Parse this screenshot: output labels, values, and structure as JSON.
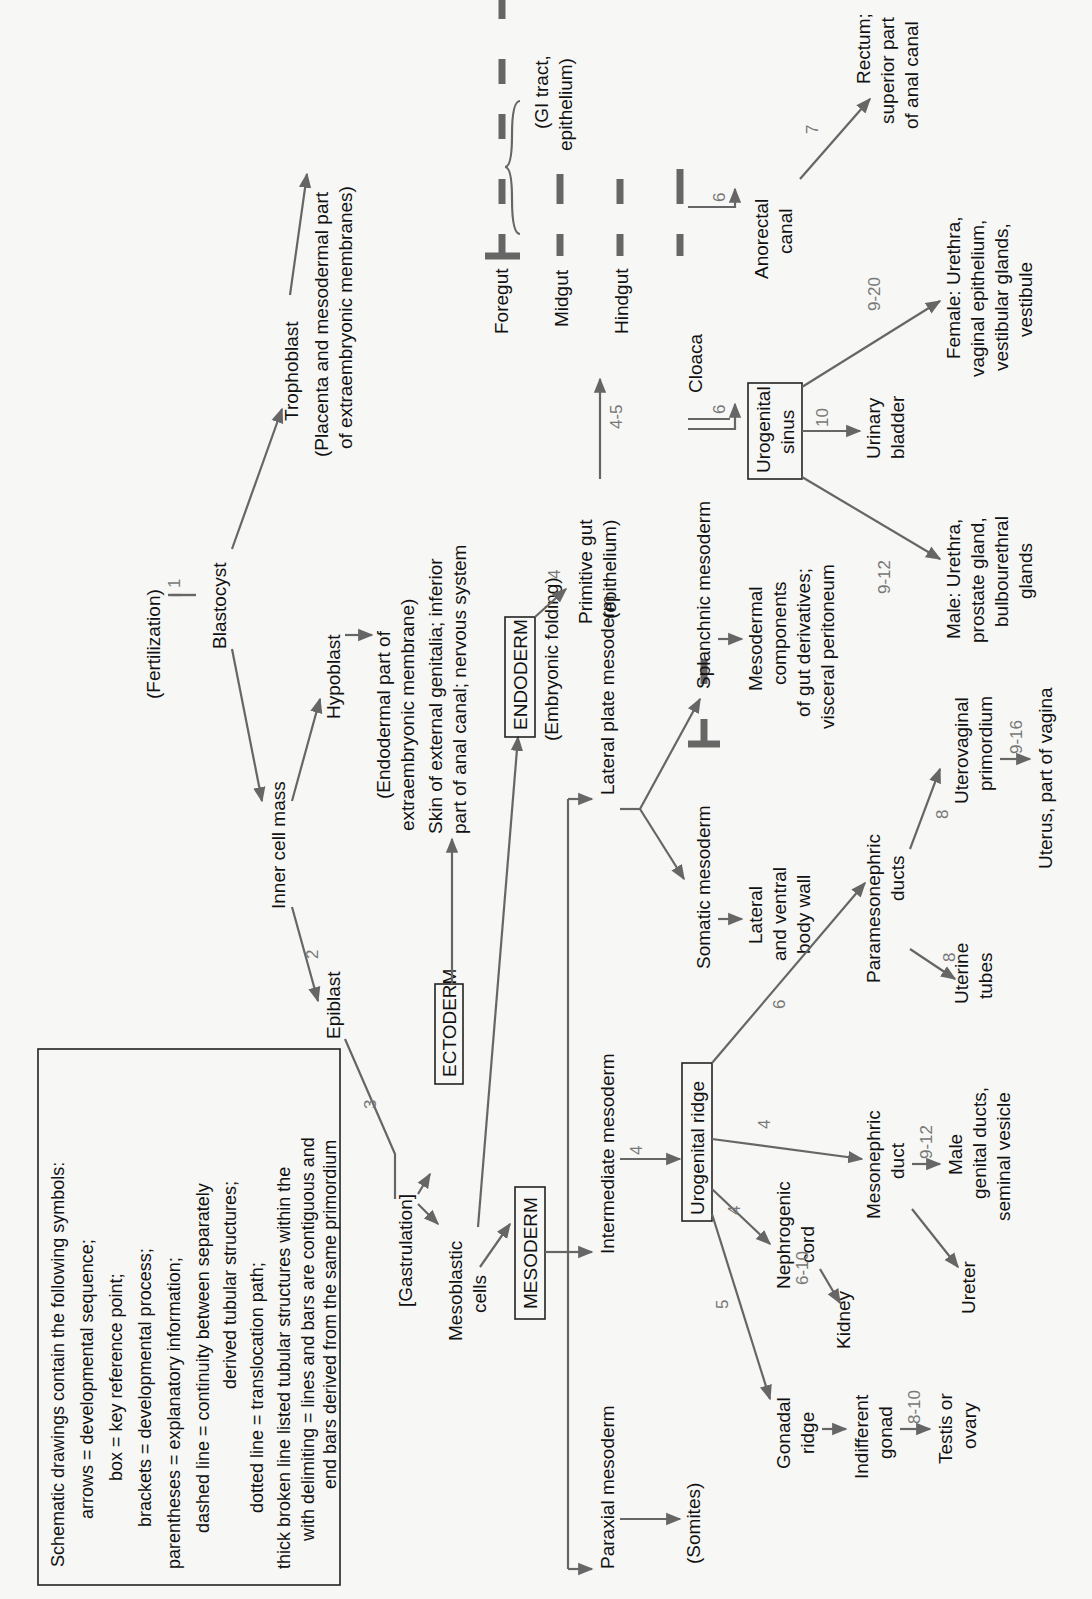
{
  "orientation": "rotated-90-ccw",
  "legend": {
    "title": "Schematic drawings contain the following symbols:",
    "lines": [
      "arrows = developmental sequence;",
      "box = key reference point;",
      "brackets = developmental process;",
      "parentheses = explanatory information;",
      "dashed line = continuity between separately",
      "derived tubular structures;",
      "dotted line = translocation path;",
      "thick broken line    listed tubular structures within the",
      "with delimiting =  lines and bars are contiguous and",
      "end bars      derived from the same primordium"
    ]
  },
  "nodes": {
    "fertilization": "(Fertilization)",
    "blastocyst": "Blastocyst",
    "trophoblast": "Trophoblast",
    "placenta": [
      "(Placenta and mesodermal part",
      "of extraembryonic membranes)"
    ],
    "inner_cell_mass": "Inner cell mass",
    "hypoblast": "Hypoblast",
    "endodermal_part": [
      "(Endodermal part of",
      "extraembryonic membrane)"
    ],
    "epiblast": "Epiblast",
    "gastrulation": "[Gastrulation]",
    "ectoderm": "ECTODERM",
    "ectoderm_derivs": [
      "Skin of external genitalia; inferior",
      "part of anal canal; nervous system"
    ],
    "mesoblastic_cells": [
      "Mesoblastic",
      "cells"
    ],
    "mesoderm": "MESODERM",
    "endoderm": "ENDODERM",
    "embryonic_folding": "(Embryonic folding)",
    "primitive_gut": [
      "Primitive gut",
      "(epithelium)"
    ],
    "foregut": "Foregut",
    "midgut": "Midgut",
    "hindgut": "Hindgut",
    "gi_tract": [
      "(GI tract,",
      "epithelium)"
    ],
    "cloaca": "Cloaca",
    "anorectal_canal": [
      "Anorectal",
      "canal"
    ],
    "rectum": [
      "Rectum;",
      "superior part",
      "of anal canal"
    ],
    "urogenital_sinus": [
      "Urogenital",
      "sinus"
    ],
    "urinary_bladder": [
      "Urinary",
      "bladder"
    ],
    "female_derivs": [
      "Female: Urethra,",
      "vaginal epithelium,",
      "vestibular glands,",
      "vestibule"
    ],
    "male_derivs": [
      "Male: Urethra,",
      "prostate gland,",
      "bulbourethral",
      "glands"
    ],
    "lateral_plate_mesoderm": "Lateral plate mesoderm",
    "splanchnic_mesoderm": "Splanchnic mesoderm",
    "mesodermal_components": [
      "Mesodermal",
      "components",
      "of gut derivatives;",
      "visceral peritoneum"
    ],
    "somatic_mesoderm": "Somatic mesoderm",
    "body_wall": [
      "Lateral",
      "and ventral",
      "body wall"
    ],
    "intermediate_mesoderm": "Intermediate mesoderm",
    "urogenital_ridge": "Urogenital ridge",
    "paramesonephric_ducts": [
      "Paramesonephric",
      "ducts"
    ],
    "uterovaginal_primordium": [
      "Uterovaginal",
      "primordium"
    ],
    "uterus": "Uterus, part of vagina",
    "uterine_tubes": [
      "Uterine",
      "tubes"
    ],
    "mesonephric_duct": [
      "Mesonephric",
      "duct"
    ],
    "male_genital_ducts": [
      "Male",
      "genital ducts,",
      "seminal vesicle"
    ],
    "ureter": "Ureter",
    "nephrogenic_cord": [
      "Nephrogenic",
      "cord"
    ],
    "kidney": "Kidney",
    "paraxial_mesoderm": "Paraxial mesoderm",
    "somites": "(Somites)",
    "gonadal_ridge": [
      "Gonadal",
      "ridge"
    ],
    "indifferent_gonad": [
      "Indifferent",
      "gonad"
    ],
    "testis_ovary": [
      "Testis or",
      "ovary"
    ]
  },
  "week_labels": {
    "fert_blast": "1",
    "icm_epiblast": "2",
    "epiblast_gastrulation": "3",
    "endoderm_gut": "4",
    "gut_foregut": "4-5",
    "cloaca_ugs": "6",
    "cloaca_anorectal": "6",
    "anorectal_rectum": "7",
    "ugs_bladder": "10",
    "ugs_female": "9-20",
    "ugs_male": "9-12",
    "im_ur": "4",
    "ur_paramesonephric": "6",
    "ur_mesonephric": "4",
    "ur_nephrogenic": "4",
    "ur_gonadal": "5",
    "nephrogenic_kidney": "6-10",
    "mesonephric_male": "9-12",
    "paramesonephric_uterovaginal": "8",
    "paramesonephric_tubes": "8",
    "uterovaginal_uterus": "9-16",
    "gonad_testis": "8-10"
  }
}
